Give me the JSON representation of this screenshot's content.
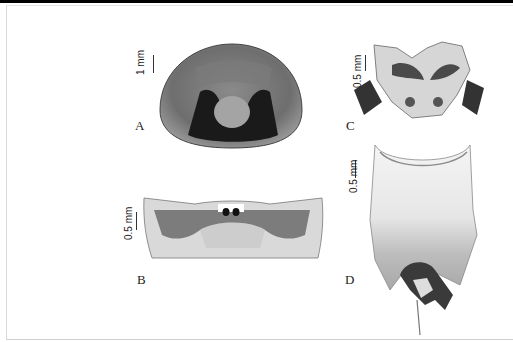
{
  "figure": {
    "panels": [
      {
        "id": "A",
        "label": "A",
        "scale": "1 mm",
        "subject": "head capsule, dorsal view"
      },
      {
        "id": "B",
        "label": "B",
        "scale": "0.5 mm",
        "subject": "sclerite, transverse view"
      },
      {
        "id": "C",
        "label": "C",
        "scale": "0.5 mm",
        "subject": "terminal segment with setose lobes"
      },
      {
        "id": "D",
        "label": "D",
        "scale": "0.5 mm",
        "subject": "abdominal segment with genitalia"
      }
    ],
    "colors": {
      "background": "#ffffff",
      "border": "#d8d8d8",
      "top_bar": "#000000",
      "label": "#222222"
    }
  }
}
